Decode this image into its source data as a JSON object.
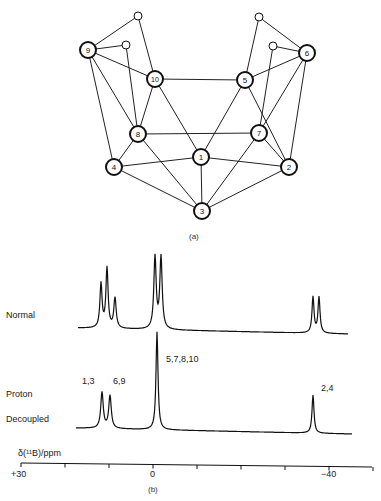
{
  "figure_a": {
    "caption": "(a)",
    "nodes": [
      {
        "id": "1",
        "x": 201,
        "y": 157,
        "r": 8,
        "label": "1"
      },
      {
        "id": "2",
        "x": 289,
        "y": 167,
        "r": 8,
        "label": "2"
      },
      {
        "id": "3",
        "x": 202,
        "y": 211,
        "r": 8,
        "label": "3"
      },
      {
        "id": "4",
        "x": 114,
        "y": 167,
        "r": 8,
        "label": "4"
      },
      {
        "id": "5",
        "x": 245,
        "y": 80,
        "r": 8,
        "label": "5"
      },
      {
        "id": "6",
        "x": 307,
        "y": 53,
        "r": 8,
        "label": "6"
      },
      {
        "id": "7",
        "x": 259,
        "y": 133,
        "r": 8,
        "label": "7"
      },
      {
        "id": "8",
        "x": 138,
        "y": 134,
        "r": 8,
        "label": "8"
      },
      {
        "id": "9",
        "x": 88,
        "y": 50,
        "r": 8,
        "label": "9"
      },
      {
        "id": "10",
        "x": 155,
        "y": 79,
        "r": 8,
        "label": "10"
      },
      {
        "id": "Ha",
        "x": 138,
        "y": 16,
        "r": 4,
        "label": ""
      },
      {
        "id": "Hb",
        "x": 126,
        "y": 45,
        "r": 4,
        "label": ""
      },
      {
        "id": "Hc",
        "x": 259,
        "y": 17,
        "r": 4,
        "label": ""
      },
      {
        "id": "Hd",
        "x": 273,
        "y": 46,
        "r": 4,
        "label": ""
      }
    ],
    "edges": [
      [
        "9",
        "Ha"
      ],
      [
        "Ha",
        "10"
      ],
      [
        "9",
        "Hb"
      ],
      [
        "Hb",
        "8"
      ],
      [
        "9",
        "10"
      ],
      [
        "9",
        "4"
      ],
      [
        "9",
        "8"
      ],
      [
        "10",
        "5"
      ],
      [
        "10",
        "8"
      ],
      [
        "10",
        "1"
      ],
      [
        "8",
        "4"
      ],
      [
        "8",
        "7"
      ],
      [
        "8",
        "3"
      ],
      [
        "5",
        "Hc"
      ],
      [
        "Hc",
        "6"
      ],
      [
        "6",
        "Hd"
      ],
      [
        "Hd",
        "7"
      ],
      [
        "5",
        "6"
      ],
      [
        "6",
        "2"
      ],
      [
        "6",
        "7"
      ],
      [
        "5",
        "1"
      ],
      [
        "5",
        "2"
      ],
      [
        "7",
        "2"
      ],
      [
        "7",
        "3"
      ],
      [
        "4",
        "1"
      ],
      [
        "1",
        "2"
      ],
      [
        "1",
        "3"
      ],
      [
        "4",
        "3"
      ],
      [
        "2",
        "3"
      ]
    ]
  },
  "figure_b": {
    "caption": "(b)",
    "traces": [
      {
        "name": "Normal",
        "labels": [
          "Normal"
        ]
      },
      {
        "name": "Proton Decoupled",
        "labels": [
          "Proton",
          "Decoupled"
        ]
      }
    ],
    "peak_labels": [
      {
        "text": "1,3",
        "x": 82,
        "y": 381
      },
      {
        "text": "6,9",
        "x": 114,
        "y": 381
      },
      {
        "text": "5,7,8,10",
        "x": 166,
        "y": 355
      },
      {
        "text": "2,4",
        "x": 321,
        "y": 384
      }
    ],
    "axis": {
      "title": "δ(¹¹B)/ppm",
      "tick_labels": [
        {
          "text": "+30",
          "x": 10
        },
        {
          "text": "0",
          "x": 150
        },
        {
          "text": "−40",
          "x": 320
        }
      ],
      "ticks_ppm": [
        30,
        20,
        10,
        0,
        -10,
        -20,
        -30,
        -40,
        -50
      ]
    }
  },
  "chart_data": {
    "type": "line",
    "xlabel": "δ(¹¹B)/ppm",
    "ylabel": "",
    "xlim": [
      30,
      -50
    ],
    "x_tick_labels": [
      "+30",
      "0",
      "-40"
    ],
    "series": [
      {
        "name": "Normal",
        "peaks_ppm": [
          11.2,
          9.8,
          8.0,
          0.5,
          -1.0,
          -36.7,
          -38.0
        ]
      },
      {
        "name": "Proton Decoupled",
        "peaks_ppm": [
          11.0,
          9.2,
          -0.9,
          -36.7
        ],
        "assignments": [
          "1,3",
          "6,9",
          "5,7,8,10",
          "2,4"
        ]
      }
    ]
  }
}
